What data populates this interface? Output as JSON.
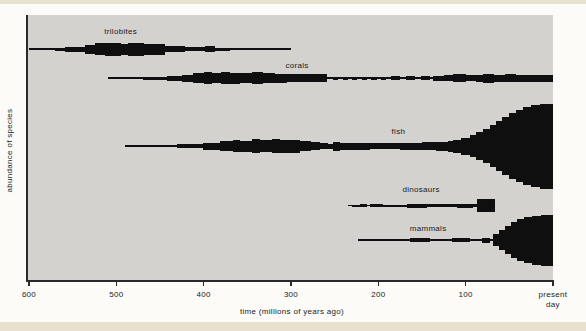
{
  "colors": {
    "spindle": "#0f0f0f",
    "panel": "#d3d2ce",
    "axis": "#2a2a2a",
    "text": "#1b1b1b",
    "page": "#fcfbf7",
    "strip": "#e8e1cd"
  },
  "chart_data": {
    "type": "area",
    "variant": "spindle-diagram",
    "title": "",
    "xlabel": "time (millions of years ago)",
    "ylabel": "abundance of species",
    "xlim": [
      600,
      0
    ],
    "grid": false,
    "value_note": "spindle thickness = relative abundance of species (axis unlabeled)",
    "x_ticks": [
      {
        "t": 600,
        "label": "600"
      },
      {
        "t": 500,
        "label": "500"
      },
      {
        "t": 400,
        "label": "400"
      },
      {
        "t": 300,
        "label": "300"
      },
      {
        "t": 200,
        "label": "200"
      },
      {
        "t": 100,
        "label": "100"
      },
      {
        "t": 0,
        "label": "present day",
        "two_line": true
      }
    ],
    "series": [
      {
        "name": "trilobites",
        "label": "trilobites",
        "label_t": 495,
        "label_y": 34,
        "row_y": 49,
        "extent": [
          600,
          300
        ],
        "segments": [
          [
            600,
            570,
            1
          ],
          [
            570,
            559,
            3
          ],
          [
            559,
            536,
            5
          ],
          [
            536,
            524,
            9
          ],
          [
            524,
            513,
            12
          ],
          [
            513,
            495,
            13
          ],
          [
            495,
            487,
            11
          ],
          [
            487,
            468,
            13
          ],
          [
            468,
            444,
            11
          ],
          [
            444,
            421,
            6
          ],
          [
            421,
            398,
            4
          ],
          [
            398,
            387,
            6
          ],
          [
            387,
            370,
            3
          ]
        ]
      },
      {
        "name": "corals",
        "label": "corals",
        "label_t": 293,
        "label_y": 68,
        "row_y": 78,
        "extent": [
          510,
          0
        ],
        "segments": [
          [
            470,
            442,
            3
          ],
          [
            442,
            425,
            5
          ],
          [
            425,
            412,
            7
          ],
          [
            412,
            400,
            10
          ],
          [
            400,
            390,
            12
          ],
          [
            390,
            380,
            10
          ],
          [
            380,
            370,
            12
          ],
          [
            370,
            358,
            11
          ],
          [
            358,
            345,
            10
          ],
          [
            345,
            332,
            12
          ],
          [
            332,
            318,
            10
          ],
          [
            318,
            305,
            9
          ],
          [
            305,
            259,
            8
          ],
          [
            252,
            246,
            3
          ],
          [
            241,
            235,
            3
          ],
          [
            230,
            224,
            3
          ],
          [
            219,
            213,
            3
          ],
          [
            208,
            202,
            3
          ],
          [
            197,
            191,
            3
          ],
          [
            185,
            175,
            4
          ],
          [
            168,
            158,
            4
          ],
          [
            151,
            141,
            4
          ],
          [
            137,
            125,
            5
          ],
          [
            125,
            114,
            6
          ],
          [
            114,
            100,
            8
          ],
          [
            100,
            88,
            6
          ],
          [
            88,
            80,
            7
          ],
          [
            80,
            68,
            9
          ],
          [
            68,
            55,
            7
          ],
          [
            55,
            42,
            8
          ],
          [
            42,
            0,
            7
          ]
        ]
      },
      {
        "name": "fish",
        "label": "fish",
        "label_t": 177,
        "label_y": 134,
        "row_y": 146,
        "extent": [
          490,
          0
        ],
        "segments": [
          [
            460,
            430,
            2
          ],
          [
            430,
            401,
            4
          ],
          [
            401,
            381,
            7
          ],
          [
            381,
            366,
            10
          ],
          [
            366,
            358,
            12
          ],
          [
            358,
            345,
            11
          ],
          [
            345,
            335,
            14
          ],
          [
            335,
            322,
            12
          ],
          [
            322,
            313,
            14
          ],
          [
            313,
            290,
            13
          ],
          [
            290,
            277,
            10
          ],
          [
            277,
            267,
            8
          ],
          [
            267,
            258,
            6
          ],
          [
            258,
            252,
            5
          ],
          [
            252,
            244,
            9
          ],
          [
            244,
            235,
            7
          ],
          [
            235,
            210,
            7
          ],
          [
            210,
            175,
            6
          ],
          [
            175,
            150,
            7
          ],
          [
            150,
            134,
            8
          ],
          [
            134,
            120,
            9
          ],
          [
            120,
            114,
            11
          ],
          [
            114,
            105,
            13
          ],
          [
            105,
            95,
            17
          ],
          [
            95,
            88,
            22
          ],
          [
            88,
            80,
            28
          ],
          [
            80,
            72,
            34
          ],
          [
            72,
            65,
            42
          ],
          [
            65,
            58,
            50
          ],
          [
            58,
            50,
            58
          ],
          [
            50,
            42,
            66
          ],
          [
            42,
            34,
            72
          ],
          [
            34,
            25,
            78
          ],
          [
            25,
            15,
            82
          ],
          [
            15,
            0,
            85
          ]
        ]
      },
      {
        "name": "dinosaurs",
        "label": "dinosaurs",
        "label_t": 151,
        "label_y": 192,
        "row_y": 205.5,
        "extent": [
          235,
          66
        ],
        "segments": [
          [
            230,
            221,
            2
          ],
          [
            221,
            213,
            3.5
          ],
          [
            210,
            195,
            3.5
          ],
          [
            195,
            167,
            2
          ],
          [
            167,
            144,
            4
          ],
          [
            144,
            137,
            2.5
          ],
          [
            137,
            110,
            3
          ],
          [
            110,
            92,
            4
          ],
          [
            92,
            87,
            3
          ],
          [
            87,
            66,
            13
          ]
        ]
      },
      {
        "name": "mammals",
        "label": "mammals",
        "label_t": 143,
        "label_y": 231,
        "row_y": 240,
        "extent": [
          223,
          0
        ],
        "segments": [
          [
            206,
            164,
            2
          ],
          [
            164,
            141,
            3.5
          ],
          [
            141,
            116,
            2
          ],
          [
            116,
            95,
            3.5
          ],
          [
            95,
            81,
            2
          ],
          [
            81,
            72,
            5
          ],
          [
            69,
            62,
            12
          ],
          [
            62,
            55,
            20
          ],
          [
            55,
            48,
            28
          ],
          [
            48,
            41,
            36
          ],
          [
            41,
            33,
            42
          ],
          [
            33,
            24,
            46
          ],
          [
            24,
            14,
            49
          ],
          [
            14,
            0,
            51
          ]
        ]
      }
    ]
  }
}
